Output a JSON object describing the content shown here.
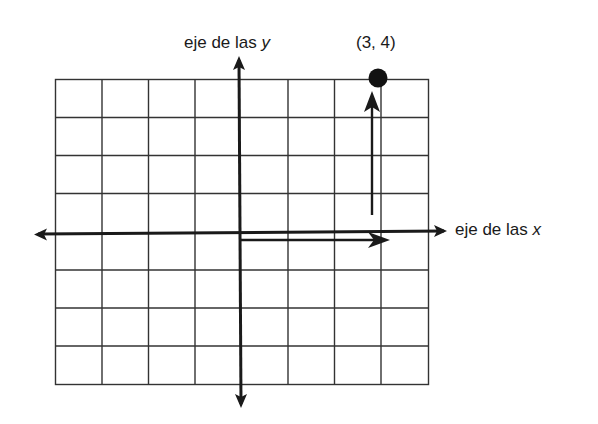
{
  "diagram": {
    "title": "",
    "y_axis": {
      "label_prefix": "eje de las ",
      "label_var": "y"
    },
    "x_axis": {
      "label_prefix": "eje de las ",
      "label_var": "x"
    },
    "point": {
      "label": "(3, 4)",
      "x": 3,
      "y": 4
    },
    "grid": {
      "columns": 8,
      "rows": 8,
      "x_range": [
        -4,
        4
      ],
      "y_range": [
        -4,
        4
      ]
    },
    "vectors": [
      {
        "name": "horizontal-component",
        "from": [
          0,
          0
        ],
        "to": [
          3,
          0
        ]
      },
      {
        "name": "vertical-component",
        "from": [
          3,
          0
        ],
        "to": [
          3,
          4
        ]
      }
    ],
    "colors": {
      "ink": "#1a1a1a",
      "grid": "#333333",
      "background": "#ffffff"
    }
  }
}
